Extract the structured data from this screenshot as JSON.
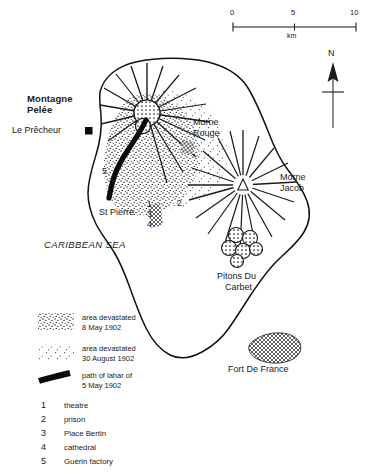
{
  "map": {
    "title_region": "Martinique",
    "scale_bar": {
      "ticks": [
        "0",
        "5",
        "10"
      ],
      "unit_label": "km"
    },
    "north_arrow": {
      "label": "N"
    },
    "labels": {
      "volcano": "Montagne\nPelée",
      "volcano_line1": "Montagne",
      "volcano_line2": "Pelée",
      "le_precheur": "Le Prêcheur",
      "morne_rouge_line1": "Morne",
      "morne_rouge_line2": "Rouge",
      "morne_jacob_line1": "Morne",
      "morne_jacob_line2": "Jacob",
      "st_pierre": "St Pierre",
      "pitons_line1": "Pitons Du",
      "pitons_line2": "Carbet",
      "fort_de_france": "Fort De France",
      "sea": "CARIBBEAN SEA"
    },
    "map_numbers": {
      "n1": "1",
      "n2": "2",
      "n3": "3",
      "n4": "4",
      "n5": "5"
    }
  },
  "legend": {
    "items": [
      {
        "swatch": "dense-stipple-swatch",
        "line1": "area devastated",
        "line2": "8 May 1902"
      },
      {
        "swatch": "sparse-stipple-swatch",
        "line1": "area devastated",
        "line2": "30 August 1902"
      },
      {
        "swatch": "lahar-path-swatch",
        "line1": "path of lahar of",
        "line2": "5 May 1902"
      }
    ]
  },
  "key": {
    "items": [
      {
        "number": "1",
        "label": "theatre"
      },
      {
        "number": "2",
        "label": "prison"
      },
      {
        "number": "3",
        "label": "Place Bertin"
      },
      {
        "number": "4",
        "label": "cathedral"
      },
      {
        "number": "5",
        "label": "Guérin factory"
      }
    ]
  },
  "colors": {
    "ink": "#1a1a1a",
    "background": "#ffffff",
    "coastline": "#111111",
    "stipple": "#333333"
  }
}
